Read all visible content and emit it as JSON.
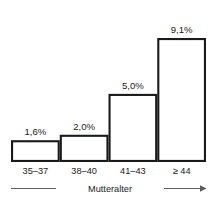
{
  "chart_data": {
    "type": "bar",
    "title": "",
    "subtitle": "",
    "xlabel": "Mutteralter",
    "ylabel": "",
    "categories": [
      "35–37",
      "38–40",
      "41–43",
      "≥ 44"
    ],
    "values": [
      1.6,
      2.0,
      5.0,
      9.1
    ],
    "data_labels": [
      "1,6%",
      "2,0%",
      "5,0%",
      "9,1%"
    ],
    "ylim": [
      0,
      9.1
    ],
    "grid": "horizontal-1-percent-steps",
    "legend": "none",
    "unit": "%",
    "colors": {
      "bar_fill": "#ffffff",
      "bar_stroke": "#1a1a1a",
      "gridline": "#b9b9b9",
      "axis": "#5d5d5d",
      "text": "#1a1a1a",
      "background": "#ffffff"
    }
  },
  "axis": {
    "x_arrow_label": "Mutteralter",
    "x_arrow_direction": "right"
  }
}
